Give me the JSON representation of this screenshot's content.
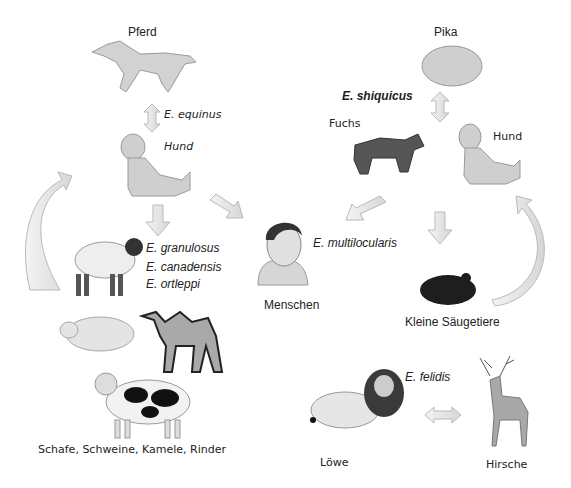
{
  "diagram": {
    "type": "transmission-cycles",
    "colors": {
      "arrow_fill": "#e6e6e6",
      "arrow_stroke": "#b9b9b9",
      "animal_gray": "#c8c8c8",
      "dark": "#2a2a2a"
    },
    "left_cycle": {
      "definitive_host_top": "Pferd",
      "species_top": "E. equinus",
      "dog_label": "Hund",
      "species_group": [
        "E. granulosus",
        "E. canadensis",
        "E. ortleppi"
      ],
      "livestock_caption": "Schafe, Schweine, Kamele, Rinder"
    },
    "right_cycle": {
      "host_top": "Pika",
      "species_top": "E. shiquicus",
      "fox_label": "Fuchs",
      "dog_label": "Hund",
      "small_mammals_label": "Kleine Säugetiere"
    },
    "center": {
      "human_label": "Menschen",
      "species": "E. multilocularis"
    },
    "bottom_cycle": {
      "species": "E. felidis",
      "lion_label": "Löwe",
      "deer_label": "Hirsche"
    }
  }
}
